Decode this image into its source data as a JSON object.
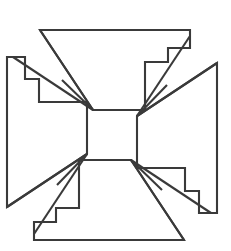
{
  "figure": {
    "title": "Stepped pinwheel cross",
    "background_color": "#ffffff",
    "stroke_color": "#3a3a3a",
    "stroke_width": 2.1,
    "fill_color": "#ffffff",
    "canvas": {
      "width": 231,
      "height": 251
    },
    "symmetry": "4-fold rotational (90 degrees) about the center",
    "center_point": {
      "x": 112,
      "y": 135
    },
    "outline_points": "40,30 190,30 190,48 168,48 168,62 145,62 145,123 131,123 131,147 112,147 112,123 93,123 93,110 40,110 40,80 13,80 13,57 40,57 40,30",
    "outline_d": "M 40,30 L 190,30 L 190,48 L 168,48 L 168,62 L 145,62 L 145,110 L 208,110 L 208,57 L 181,57 L 181,80 L 208,80 L 208,201 L 190,201 L 190,180 L 168,180 L 168,167 L 145,167 L 145,147 L 112,147",
    "apex_points": [
      {
        "name": "top-left-apex",
        "x": 93,
        "y": 110
      },
      {
        "name": "top-right-apex",
        "x": 145,
        "y": 110
      },
      {
        "name": "bottom-right-apex",
        "x": 145,
        "y": 160
      },
      {
        "name": "bottom-left-apex",
        "x": 93,
        "y": 160
      }
    ],
    "arms": [
      {
        "name": "top-arm",
        "apex": "top-left-apex"
      },
      {
        "name": "right-arm",
        "apex": "top-right-apex"
      },
      {
        "name": "bottom-arm",
        "apex": "bottom-right-apex"
      },
      {
        "name": "left-arm",
        "apex": "bottom-left-apex"
      }
    ],
    "spokes": [
      {
        "arm": "top-arm",
        "from": {
          "x": 93,
          "y": 110
        },
        "to": {
          "x": 40,
          "y": 30
        }
      },
      {
        "arm": "top-arm",
        "from": {
          "x": 93,
          "y": 110
        },
        "to": {
          "x": 13,
          "y": 57
        }
      },
      {
        "arm": "top-arm",
        "from": {
          "x": 93,
          "y": 110
        },
        "to": {
          "x": 13,
          "y": 80
        }
      },
      {
        "arm": "right-arm",
        "from": {
          "x": 145,
          "y": 110
        },
        "to": {
          "x": 190,
          "y": 30
        }
      },
      {
        "arm": "right-arm",
        "from": {
          "x": 145,
          "y": 110
        },
        "to": {
          "x": 190,
          "y": 48
        }
      },
      {
        "arm": "right-arm",
        "from": {
          "x": 145,
          "y": 110
        },
        "to": {
          "x": 208,
          "y": 57
        }
      },
      {
        "arm": "bottom-arm",
        "from": {
          "x": 145,
          "y": 160
        },
        "to": {
          "x": 190,
          "y": 228
        }
      },
      {
        "arm": "bottom-arm",
        "from": {
          "x": 145,
          "y": 160
        },
        "to": {
          "x": 208,
          "y": 201
        }
      },
      {
        "arm": "bottom-arm",
        "from": {
          "x": 145,
          "y": 160
        },
        "to": {
          "x": 208,
          "y": 180
        }
      },
      {
        "arm": "left-arm",
        "from": {
          "x": 93,
          "y": 160
        },
        "to": {
          "x": 40,
          "y": 228
        }
      },
      {
        "arm": "left-arm",
        "from": {
          "x": 93,
          "y": 160
        },
        "to": {
          "x": 13,
          "y": 201
        }
      },
      {
        "arm": "left-arm",
        "from": {
          "x": 93,
          "y": 160
        },
        "to": {
          "x": 13,
          "y": 180
        }
      }
    ]
  }
}
